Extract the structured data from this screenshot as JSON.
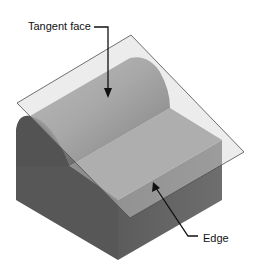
{
  "figure": {
    "type": "isometric-solid-with-tangent-plane",
    "labels": {
      "tangent_face": "Tangent face",
      "edge": "Edge"
    },
    "colors": {
      "background": "#ffffff",
      "left_face": "#5a5a5a",
      "front_face": "#6a6a6a",
      "top_flat_face": "#8c8c8c",
      "cylinder_light": "#9a9a9a",
      "cylinder_dark": "#4a4a4a",
      "cylinder_end": "#4e4e4e",
      "plane_fill": "#d8d8d8",
      "plane_stroke": "#555555",
      "leader": "#111111"
    }
  }
}
